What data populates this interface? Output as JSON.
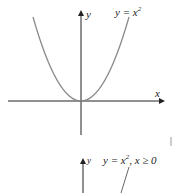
{
  "diagram": {
    "top_graph": {
      "curve_label": "y = x",
      "curve_label_exp": "2",
      "x_axis_label": "x",
      "y_axis_label": "y"
    },
    "bottom_graph": {
      "curve_label": "y = x",
      "curve_label_exp": "2",
      "curve_label_suffix": ", x ≥ 0",
      "y_axis_label": "y"
    },
    "colors": {
      "axis": "#222222",
      "curve": "#8a8a8a"
    }
  }
}
